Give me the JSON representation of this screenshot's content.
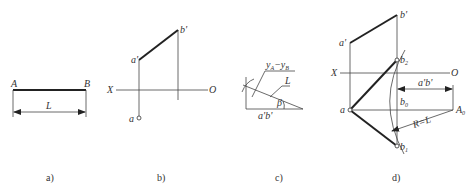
{
  "panels": {
    "a": {
      "caption": "a)",
      "label_A": "A",
      "label_B": "B",
      "label_length": "L"
    },
    "b": {
      "caption": "b)",
      "label_a_prime": "a'",
      "label_b_prime": "b'",
      "label_a": "a",
      "label_X": "X",
      "label_O": "O"
    },
    "c": {
      "caption": "c)",
      "label_yA_yB": "y",
      "sub_A": "A",
      "minus": "−y",
      "sub_B": "B",
      "label_L": "L",
      "label_beta": "β",
      "label_apbp": "a'b'"
    },
    "d": {
      "caption": "d)",
      "label_a_prime": "a'",
      "label_b_prime": "b'",
      "label_a": "a",
      "label_X": "X",
      "label_O": "O",
      "label_b2": "b",
      "sub_2": "2",
      "label_b0": "b",
      "sub_0": "0",
      "label_b1": "b",
      "sub_1": "1",
      "label_A0": "A",
      "sub_A0": "0",
      "label_apbp": "a'b'",
      "label_radius": "R=L"
    }
  }
}
